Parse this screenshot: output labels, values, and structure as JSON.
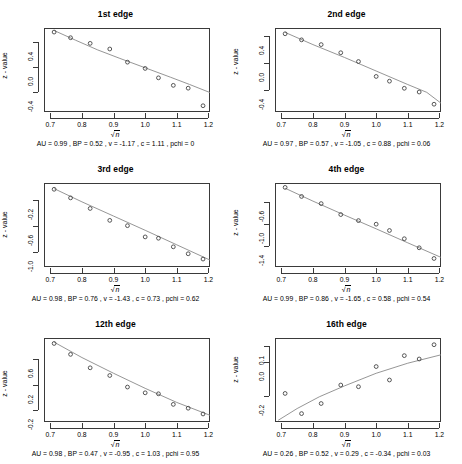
{
  "figure": {
    "xlabel_text": "n",
    "ylabel": "z - value",
    "x_ticks": [
      "0.7",
      "0.8",
      "0.9",
      "1.0",
      "1.1",
      "1.2"
    ],
    "x_tick_values": [
      0.7,
      0.8,
      0.9,
      1.0,
      1.1,
      1.2
    ],
    "xlim": [
      0.68,
      1.205
    ]
  },
  "chart_data": [
    {
      "type": "scatter",
      "title": "1st edge",
      "xlabel": "sqrt(n)",
      "ylabel": "z - value",
      "xlim": [
        0.68,
        1.205
      ],
      "ylim": [
        -0.72,
        0.62
      ],
      "y_ticks": [
        0.4,
        0.0,
        -0.4
      ],
      "y_tick_labels": [
        "0.4",
        "0.0",
        "-0.4"
      ],
      "grid": false,
      "x": [
        0.712,
        0.764,
        0.826,
        0.888,
        0.944,
        1.0,
        1.042,
        1.089,
        1.136,
        1.183
      ],
      "y": [
        0.555,
        0.465,
        0.375,
        0.285,
        0.075,
        -0.025,
        -0.175,
        -0.295,
        -0.34,
        -0.62
      ],
      "fit_curve": {
        "x": [
          0.712,
          0.78,
          0.85,
          0.92,
          1.0,
          1.08,
          1.14,
          1.205
        ],
        "y": [
          0.58,
          0.425,
          0.27,
          0.135,
          -0.015,
          -0.165,
          -0.28,
          -0.41
        ]
      },
      "annotation": "AU =  0.99 , BP =  0.52 , v =  -1.17 , c =  1.11 , pchi =  0",
      "stats": {
        "AU": "0.99",
        "BP": "0.52",
        "v": "-1.17",
        "c": "1.11",
        "pchi": "0"
      }
    },
    {
      "type": "scatter",
      "title": "2nd edge",
      "xlabel": "sqrt(n)",
      "ylabel": "z - value",
      "xlim": [
        0.68,
        1.205
      ],
      "ylim": [
        -0.72,
        0.52
      ],
      "y_ticks": [
        0.4,
        0.0,
        -0.4
      ],
      "y_tick_labels": [
        "0.4",
        "0.0",
        "-0.4"
      ],
      "grid": false,
      "x": [
        0.712,
        0.764,
        0.826,
        0.888,
        0.944,
        1.0,
        1.042,
        1.089,
        1.136,
        1.183
      ],
      "y": [
        0.435,
        0.345,
        0.275,
        0.155,
        0.025,
        -0.195,
        -0.265,
        -0.37,
        -0.425,
        -0.605
      ],
      "fit_curve": {
        "x": [
          0.712,
          0.8,
          0.9,
          1.0,
          1.1,
          1.16,
          1.205
        ],
        "y": [
          0.455,
          0.275,
          0.085,
          -0.115,
          -0.315,
          -0.43,
          -0.59
        ]
      },
      "annotation": "AU =  0.97 , BP =  0.57 , v =  -1.05 , c =  0.88 , pchi =  0.06",
      "stats": {
        "AU": "0.97",
        "BP": "0.57",
        "v": "-1.05",
        "c": "0.88",
        "pchi": "0.06"
      }
    },
    {
      "type": "scatter",
      "title": "3rd edge",
      "xlabel": "sqrt(n)",
      "ylabel": "z - value",
      "xlim": [
        0.68,
        1.205
      ],
      "ylim": [
        -1.22,
        0.05
      ],
      "y_ticks": [
        -0.2,
        -0.6,
        -1.0
      ],
      "y_tick_labels": [
        "-0.2",
        "-0.6",
        "-1.0"
      ],
      "grid": false,
      "x": [
        0.712,
        0.764,
        0.826,
        0.888,
        0.944,
        1.0,
        1.042,
        1.089,
        1.136,
        1.183
      ],
      "y": [
        -0.045,
        -0.175,
        -0.335,
        -0.515,
        -0.595,
        -0.765,
        -0.785,
        -0.915,
        -1.02,
        -1.1
      ],
      "fit_curve": {
        "x": [
          0.712,
          0.8,
          0.9,
          1.0,
          1.1,
          1.205
        ],
        "y": [
          -0.035,
          -0.235,
          -0.45,
          -0.665,
          -0.885,
          -1.115
        ]
      },
      "annotation": "AU =  0.98 , BP =  0.76 , v =  -1.43 , c =  0.73 , pchi =  0.62",
      "stats": {
        "AU": "0.98",
        "BP": "0.76",
        "v": "-1.43",
        "c": "0.73",
        "pchi": "0.62"
      }
    },
    {
      "type": "scatter",
      "title": "4th edge",
      "xlabel": "sqrt(n)",
      "ylabel": "z - value",
      "xlim": [
        0.68,
        1.205
      ],
      "ylim": [
        -1.78,
        -0.25
      ],
      "y_ticks": [
        -0.6,
        -1.0,
        -1.4
      ],
      "y_tick_labels": [
        "-0.6",
        "-1.0",
        "-1.4"
      ],
      "grid": false,
      "x": [
        0.712,
        0.764,
        0.826,
        0.888,
        0.944,
        1.0,
        1.042,
        1.089,
        1.136,
        1.183
      ],
      "y": [
        -0.33,
        -0.495,
        -0.625,
        -0.825,
        -0.935,
        -1.0,
        -1.115,
        -1.265,
        -1.43,
        -1.625
      ],
      "fit_curve": {
        "x": [
          0.712,
          0.8,
          0.9,
          1.0,
          1.1,
          1.205
        ],
        "y": [
          -0.345,
          -0.58,
          -0.835,
          -1.085,
          -1.34,
          -1.605
        ]
      },
      "annotation": "AU =  0.99 , BP =  0.86 , v =  -1.65 , c =  0.58 , pchi =  0.54",
      "stats": {
        "AU": "0.99",
        "BP": "0.86",
        "v": "-1.65",
        "c": "0.58",
        "pchi": "0.54"
      }
    },
    {
      "type": "scatter",
      "title": "12th edge",
      "xlabel": "sqrt(n)",
      "ylabel": "z - value",
      "xlim": [
        0.68,
        1.205
      ],
      "ylim": [
        -0.38,
        0.93
      ],
      "y_ticks": [
        0.6,
        0.2,
        -0.2
      ],
      "y_tick_labels": [
        "0.6",
        "0.2",
        "-0.2"
      ],
      "grid": false,
      "x": [
        0.712,
        0.764,
        0.826,
        0.888,
        0.944,
        1.0,
        1.042,
        1.089,
        1.136,
        1.183
      ],
      "y": [
        0.845,
        0.675,
        0.465,
        0.345,
        0.165,
        0.075,
        0.06,
        -0.105,
        -0.165,
        -0.255
      ],
      "fit_curve": {
        "x": [
          0.712,
          0.8,
          0.9,
          1.0,
          1.1,
          1.205
        ],
        "y": [
          0.865,
          0.625,
          0.38,
          0.145,
          -0.075,
          -0.275
        ]
      },
      "annotation": "AU =  0.98 , BP =  0.47 , v =  -0.95 , c =  1.03 , pchi =  0.95",
      "stats": {
        "AU": "0.98",
        "BP": "0.47",
        "v": "-0.95",
        "c": "1.03",
        "pchi": "0.95"
      }
    },
    {
      "type": "scatter",
      "title": "16th edge",
      "xlabel": "sqrt(n)",
      "ylabel": "z - value",
      "xlim": [
        0.68,
        1.205
      ],
      "ylim": [
        -0.355,
        0.145
      ],
      "y_ticks": [
        0.1,
        0.0,
        -0.2
      ],
      "y_tick_labels": [
        "0.1",
        "0.0",
        "-0.2"
      ],
      "grid": false,
      "x": [
        0.712,
        0.764,
        0.826,
        0.888,
        0.944,
        1.0,
        1.042,
        1.089,
        1.136,
        1.183
      ],
      "y": [
        -0.185,
        -0.305,
        -0.245,
        -0.135,
        -0.145,
        -0.025,
        -0.105,
        0.04,
        0.02,
        0.105
      ],
      "fit_curve": {
        "x": [
          0.69,
          0.75,
          0.82,
          0.9,
          1.0,
          1.1,
          1.205
        ],
        "y": [
          -0.345,
          -0.275,
          -0.205,
          -0.14,
          -0.065,
          -0.005,
          0.045
        ]
      },
      "annotation": "AU =  0.26 , BP =  0.52 , v =  0.29 , c =  -0.34 , pchi =  0.03",
      "stats": {
        "AU": "0.26",
        "BP": "0.52",
        "v": "0.29",
        "c": "-0.34",
        "pchi": "0.03"
      }
    }
  ]
}
